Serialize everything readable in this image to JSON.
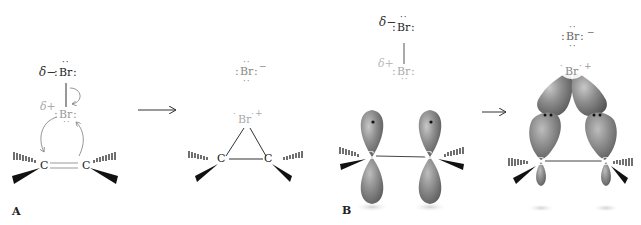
{
  "figure": {
    "panels": [
      {
        "label": "A",
        "steps": [
          {
            "name": "reactants",
            "bromine_top": {
              "symbol": "Br",
              "partial_charge": "δ−"
            },
            "bromine_bottom": {
              "symbol": "Br",
              "partial_charge": "δ+"
            },
            "carbons": [
              "C",
              "C"
            ],
            "bond": "double"
          },
          {
            "name": "products",
            "bromide": {
              "symbol": "Br",
              "charge": "−"
            },
            "bromonium": {
              "symbol": "Br",
              "charge": "+"
            },
            "carbons": [
              "C",
              "C"
            ],
            "bond": "single"
          }
        ]
      },
      {
        "label": "B",
        "steps": [
          {
            "name": "reactants-orbitals",
            "bromine_top": {
              "symbol": "Br",
              "partial_charge": "δ−"
            },
            "bromine_bottom": {
              "symbol": "Br",
              "partial_charge": "δ+"
            },
            "carbons": [
              "C",
              "C"
            ],
            "orbitals": "p-orbitals"
          },
          {
            "name": "products-orbitals",
            "bromide": {
              "symbol": "Br",
              "charge": "−"
            },
            "bromonium": {
              "symbol": "Br",
              "charge": "+"
            },
            "carbons": [
              "C",
              "C"
            ],
            "orbitals": "bonding-orbitals"
          }
        ]
      }
    ],
    "colors": {
      "ink": "#222222",
      "faded": "#9a9a9a",
      "orbital": "#8a8a8a",
      "orbital_dark": "#5a5a5a"
    }
  }
}
